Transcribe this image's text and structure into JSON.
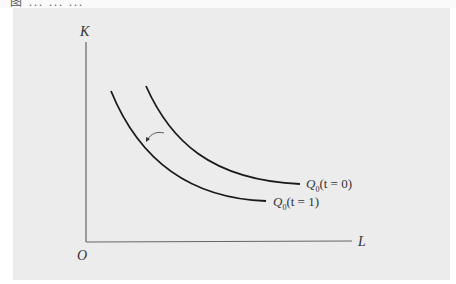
{
  "header_fragment": "图 ... ... ...",
  "diagram": {
    "type": "isoquant-shift",
    "axes": {
      "y_label": "K",
      "x_label": "L",
      "origin_label": "O"
    },
    "curves": [
      {
        "name": "Q0(t=0)",
        "symbol": "Q",
        "subscript": "0",
        "arg": "(t = 0)",
        "position": "outer"
      },
      {
        "name": "Q0(t=1)",
        "symbol": "Q",
        "subscript": "0",
        "arg": "(t = 1)",
        "position": "inner"
      }
    ],
    "annotation": "arrow indicating inward shift of isoquant from t=0 to t=1"
  },
  "colors": {
    "background": "#ececec",
    "line": "#1a1a1a",
    "axis": "#555555"
  }
}
